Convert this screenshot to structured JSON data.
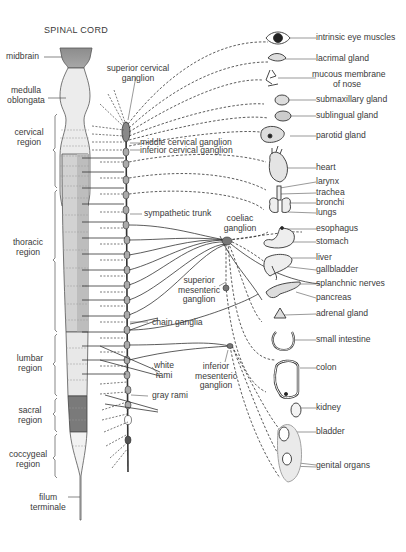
{
  "title": "SPINAL CORD",
  "cord_labels": {
    "midbrain": "midbrain",
    "medulla": [
      "medulla",
      "oblongata"
    ],
    "cervical": [
      "cervical",
      "region"
    ],
    "thoracic": [
      "thoracic",
      "region"
    ],
    "lumbar": [
      "lumbar",
      "region"
    ],
    "sacral": [
      "sacral",
      "region"
    ],
    "coccygeal": [
      "coccygeal",
      "region"
    ],
    "filum": [
      "filum",
      "terminale"
    ]
  },
  "ganglia_labels": {
    "superior_cervical": [
      "superior cervical",
      "ganglion"
    ],
    "middle_cervical": "middle cervical ganglion",
    "inferior_cervical": "inferior cervical ganglion",
    "sympathetic_trunk": "sympathetic trunk",
    "coeliac": [
      "coeliac",
      "ganglion"
    ],
    "superior_mesenteric": [
      "superior",
      "mesenteric",
      "ganglion"
    ],
    "chain_ganglia": "chain ganglia",
    "white_rami": [
      "white",
      "rami"
    ],
    "gray_rami": "gray rami",
    "inferior_mesenteric": [
      "inferior",
      "mesenteric",
      "ganglion"
    ]
  },
  "organs": [
    {
      "id": "eye",
      "label": "intrinsic eye muscles"
    },
    {
      "id": "lacrimal",
      "label": "lacrimal gland"
    },
    {
      "id": "nose",
      "label": [
        "mucous membrane",
        "of nose"
      ]
    },
    {
      "id": "submaxillary",
      "label": "submaxillary gland"
    },
    {
      "id": "sublingual",
      "label": "sublingual gland"
    },
    {
      "id": "parotid",
      "label": "parotid gland"
    },
    {
      "id": "heart",
      "label": "heart"
    },
    {
      "id": "larynx",
      "label": "larynx"
    },
    {
      "id": "trachea",
      "label": "trachea"
    },
    {
      "id": "bronchi",
      "label": "bronchi"
    },
    {
      "id": "lungs",
      "label": "lungs"
    },
    {
      "id": "esophagus",
      "label": "esophagus"
    },
    {
      "id": "stomach",
      "label": "stomach"
    },
    {
      "id": "liver",
      "label": "liver"
    },
    {
      "id": "gallbladder",
      "label": "gallbladder"
    },
    {
      "id": "splanchnic",
      "label": "splanchnic nerves"
    },
    {
      "id": "pancreas",
      "label": "pancreas"
    },
    {
      "id": "adrenal",
      "label": "adrenal gland"
    },
    {
      "id": "small_intestine",
      "label": "small intestine"
    },
    {
      "id": "colon",
      "label": "colon"
    },
    {
      "id": "kidney",
      "label": "kidney"
    },
    {
      "id": "bladder",
      "label": "bladder"
    },
    {
      "id": "genital",
      "label": "genital organs"
    }
  ]
}
